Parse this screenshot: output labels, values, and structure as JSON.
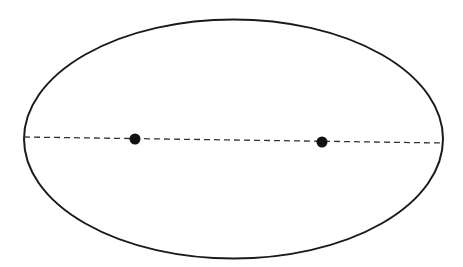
{
  "diagram": {
    "type": "ellipse-with-foci",
    "ellipse": {
      "cx": 233.5,
      "cy": 139,
      "rx": 209.5,
      "ry": 119.5,
      "stroke": "#1a1a1a",
      "stroke_width": 2
    },
    "major_axis": {
      "x1": 24,
      "y1": 137,
      "x2": 443,
      "y2": 143,
      "style": "dashed",
      "stroke": "#333333"
    },
    "foci": [
      {
        "cx": 135,
        "cy": 139,
        "r": 5.5,
        "fill": "#111111"
      },
      {
        "cx": 322,
        "cy": 142,
        "r": 5.5,
        "fill": "#111111"
      }
    ]
  }
}
